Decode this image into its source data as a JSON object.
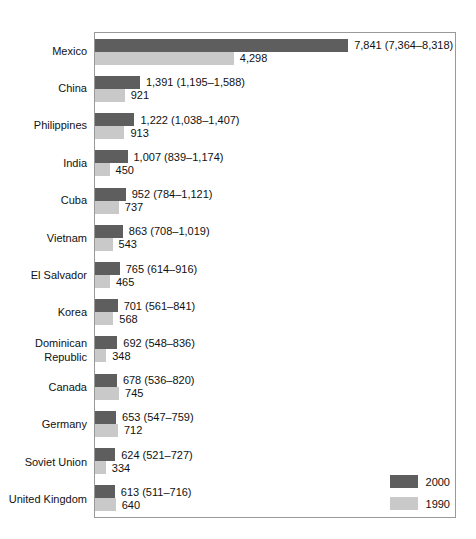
{
  "chart_data": {
    "type": "bar",
    "orientation": "horizontal",
    "title": "",
    "xlabel": "",
    "ylabel": "",
    "xlim": [
      0,
      11150
    ],
    "grid": false,
    "legend_position": "bottom-right",
    "series": [
      {
        "name": "2000",
        "color": "#5e5e5e"
      },
      {
        "name": "1990",
        "color": "#c9c9c9"
      }
    ],
    "categories": [
      "Mexico",
      "China",
      "Philippines",
      "India",
      "Cuba",
      "Vietnam",
      "El Salvador",
      "Korea",
      "Dominican Republic",
      "Canada",
      "Germany",
      "Soviet Union",
      "United Kingdom"
    ],
    "rows": [
      {
        "country": "Mexico",
        "value_2000": 7841,
        "label_2000": "7,841 (7,364–8,318)",
        "value_1990": 4298,
        "label_1990": "4,298"
      },
      {
        "country": "China",
        "value_2000": 1391,
        "label_2000": "1,391 (1,195–1,588)",
        "value_1990": 921,
        "label_1990": "921"
      },
      {
        "country": "Philippines",
        "value_2000": 1222,
        "label_2000": "1,222 (1,038–1,407)",
        "value_1990": 913,
        "label_1990": "913"
      },
      {
        "country": "India",
        "value_2000": 1007,
        "label_2000": "1,007 (839–1,174)",
        "value_1990": 450,
        "label_1990": "450"
      },
      {
        "country": "Cuba",
        "value_2000": 952,
        "label_2000": "952 (784–1,121)",
        "value_1990": 737,
        "label_1990": "737"
      },
      {
        "country": "Vietnam",
        "value_2000": 863,
        "label_2000": "863 (708–1,019)",
        "value_1990": 543,
        "label_1990": "543"
      },
      {
        "country": "El Salvador",
        "value_2000": 765,
        "label_2000": "765 (614–916)",
        "value_1990": 465,
        "label_1990": "465"
      },
      {
        "country": "Korea",
        "value_2000": 701,
        "label_2000": "701 (561–841)",
        "value_1990": 568,
        "label_1990": "568"
      },
      {
        "country": "Dominican Republic",
        "value_2000": 692,
        "label_2000": "692 (548–836)",
        "value_1990": 348,
        "label_1990": "348"
      },
      {
        "country": "Canada",
        "value_2000": 678,
        "label_2000": "678 (536–820)",
        "value_1990": 745,
        "label_1990": "745"
      },
      {
        "country": "Germany",
        "value_2000": 653,
        "label_2000": "653 (547–759)",
        "value_1990": 712,
        "label_1990": "712"
      },
      {
        "country": "Soviet Union",
        "value_2000": 624,
        "label_2000": "624 (521–727)",
        "value_1990": 334,
        "label_1990": "334"
      },
      {
        "country": "United Kingdom",
        "value_2000": 613,
        "label_2000": "613 (511–716)",
        "value_1990": 640,
        "label_1990": "640"
      }
    ]
  }
}
